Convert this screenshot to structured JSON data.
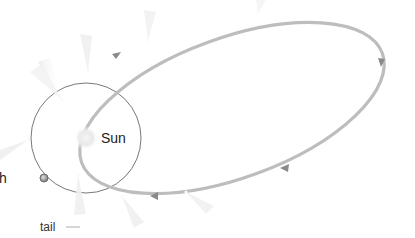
{
  "diagram": {
    "labels": {
      "sun": "Sun",
      "earth": "h",
      "tail": "tail"
    },
    "colors": {
      "background": "#ffffff",
      "comet_orbit": "#bdbdbd",
      "orbit_arrow": "#8a8a8a",
      "earth_orbit": "#555555",
      "sun_glow": "#e6e6e6",
      "earth": "#8c8c8c",
      "tail": "#eeeeee",
      "label_text": "#222222"
    },
    "elements": {
      "sun": {
        "cx": 86,
        "cy": 138,
        "r": 10
      },
      "earth_orbit": {
        "cx": 86,
        "cy": 138,
        "r": 55
      },
      "earth": {
        "cx": 44,
        "cy": 178,
        "r": 4
      },
      "comet_orbit": {
        "cx": 232,
        "cy": 105,
        "rx": 155,
        "ry": 74,
        "rotation": -22
      }
    },
    "comet_positions": [
      {
        "x": 62,
        "y": 100,
        "tail_angle": -120
      },
      {
        "x": 88,
        "y": 72,
        "tail_angle": -100
      },
      {
        "x": 148,
        "y": 40,
        "tail_angle": -80
      },
      {
        "x": 258,
        "y": 13,
        "tail_angle": -80
      },
      {
        "x": 18,
        "y": 145,
        "tail_angle": 170
      },
      {
        "x": 78,
        "y": 175,
        "tail_angle": 95
      },
      {
        "x": 122,
        "y": 196,
        "tail_angle": 60
      },
      {
        "x": 186,
        "y": 192,
        "tail_angle": 40
      }
    ],
    "direction_arrows": [
      {
        "x": 117,
        "y": 55,
        "angle": -30
      },
      {
        "x": 381,
        "y": 62,
        "angle": 80
      },
      {
        "x": 284,
        "y": 168,
        "angle": 200
      },
      {
        "x": 154,
        "y": 196,
        "angle": 180
      }
    ]
  }
}
